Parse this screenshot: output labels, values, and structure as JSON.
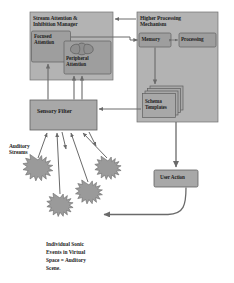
{
  "diagram": {
    "title_text": "Auditory attention and processing model",
    "blocks": {
      "stream_manager": {
        "label": "Stream Attention &\nInhibition Manager",
        "fill": "#b3b3b3",
        "stroke": "#6f6f6f"
      },
      "focused_attention": {
        "label": "Focused\nAttention",
        "fill": "#9e9e9e",
        "stroke": "#5f5f5f"
      },
      "peripheral_attention": {
        "label": "Peripheral\nAttention",
        "fill": "#9e9e9e",
        "stroke": "#5f5f5f"
      },
      "higher_processing": {
        "label": "Higher Processing\nMechanism",
        "fill": "#b3b3b3",
        "stroke": "#6f6f6f"
      },
      "memory": {
        "label": "Memory",
        "fill": "#9e9e9e",
        "stroke": "#5f5f5f"
      },
      "processing": {
        "label": "Processing",
        "fill": "#9e9e9e",
        "stroke": "#5f5f5f"
      },
      "schema_templates": {
        "label": "Schema\nTemplates",
        "fill": "#a8a8a8",
        "stroke": "#5f5f5f"
      },
      "sensory_filter": {
        "label": "Sensory Filter",
        "fill": "#a8a8a8",
        "stroke": "#5f5f5f"
      },
      "user_action": {
        "label": "User Action",
        "fill": "#a8a8a8",
        "stroke": "#5f5f5f"
      }
    },
    "annotations": {
      "auditory_streams": "Auditory\nStreams",
      "caption": "Individual Sonic\nEvents in Virtual\nSpace = Auditory\nScene."
    },
    "sonic_events": {
      "count": 4,
      "fill": "#9a9a9a",
      "stroke": "#6a6a6a"
    },
    "colors": {
      "background": "#ffffff",
      "arrow": "#6a6a6a",
      "text": "#1e1e1e",
      "panel_fill": "#b3b3b3",
      "inner_fill": "#9e9e9e"
    }
  }
}
